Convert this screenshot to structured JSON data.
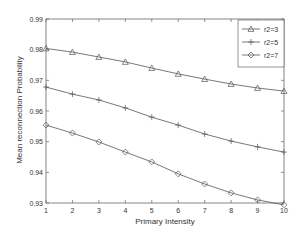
{
  "chart_data": {
    "type": "line",
    "title": "",
    "xlabel": "Primary Intensity",
    "ylabel": "Mean reconnection Probability",
    "x": [
      1,
      2,
      3,
      4,
      5,
      6,
      7,
      8,
      9,
      10
    ],
    "xlim": [
      1,
      10
    ],
    "ylim": [
      0.93,
      0.99
    ],
    "xticks": [
      "1",
      "2",
      "3",
      "4",
      "5",
      "6",
      "7",
      "8",
      "9",
      "10"
    ],
    "yticks": [
      "0.93",
      "0.94",
      "0.95",
      "0.96",
      "0.97",
      "0.98",
      "0.99"
    ],
    "grid": false,
    "legend_position": "upper right",
    "series": [
      {
        "name": "r2=3",
        "marker": "triangle",
        "values": [
          0.9804,
          0.9792,
          0.9776,
          0.976,
          0.974,
          0.9721,
          0.9704,
          0.9688,
          0.9675,
          0.9665
        ]
      },
      {
        "name": "r2=5",
        "marker": "plus",
        "values": [
          0.9678,
          0.9655,
          0.9636,
          0.961,
          0.958,
          0.9554,
          0.9525,
          0.9502,
          0.9483,
          0.9466
        ]
      },
      {
        "name": "r2=7",
        "marker": "diamond",
        "values": [
          0.9554,
          0.9528,
          0.9499,
          0.9466,
          0.9434,
          0.9395,
          0.9362,
          0.9333,
          0.931,
          0.9294
        ]
      }
    ]
  },
  "colors": {
    "line": "#555555",
    "axis": "#666666",
    "text": "#333333"
  }
}
